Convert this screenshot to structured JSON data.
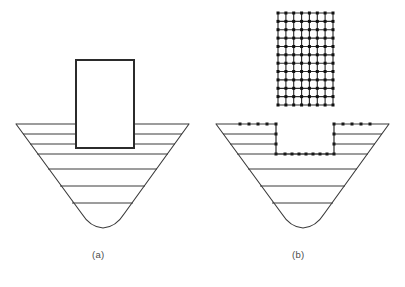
{
  "figure": {
    "background_color": "#ffffff",
    "line_color": "#3a3a3a",
    "node_color": "#1a1a1a",
    "caption_color": "#4a4a4a",
    "panels": [
      {
        "id": "a",
        "caption": "(a)",
        "description": "Stratified funnel-shaped vessel cross-section with embedded rectangular block at top center",
        "vessel": {
          "top_left_x": 16,
          "top_right_x": 189,
          "top_y": 124,
          "bottom_y": 228,
          "bottom_flat_left_x": 82,
          "bottom_flat_right_x": 124,
          "wall_taper": "linear-converging",
          "bottom_profile": "rounded-u",
          "layer_line_count": 8,
          "layer_line_y": [
            124,
            134,
            144,
            154,
            169,
            186,
            203,
            215
          ]
        },
        "block": {
          "left_x": 76,
          "right_x": 134,
          "top_y": 60,
          "bottom_y": 148,
          "fill": "#ffffff",
          "stroke_width": 2
        }
      },
      {
        "id": "b",
        "caption": "(b)",
        "description": "Same vessel with rectangular notch excavated at top center, node markers on excavation boundary, plus detached finite-element mesh of the excavated block above",
        "vessel": {
          "top_left_x": 216,
          "top_right_x": 389,
          "top_y": 124,
          "bottom_y": 228,
          "bottom_flat_left_x": 282,
          "bottom_flat_right_x": 324,
          "wall_taper": "linear-converging",
          "bottom_profile": "rounded-u",
          "layer_line_count": 8,
          "layer_line_y": [
            124,
            134,
            144,
            154,
            169,
            186,
            203,
            215
          ]
        },
        "notch": {
          "left_x": 276,
          "right_x": 334,
          "top_y": 124,
          "bottom_y": 154,
          "boundary_nodes": true,
          "node_count_top_left": 5,
          "node_count_top_right": 5,
          "node_count_bottom": 9,
          "node_count_left_wall": 3,
          "node_count_right_wall": 3
        },
        "mesh": {
          "left_x": 278,
          "right_x": 333,
          "top_y": 13,
          "bottom_y": 105,
          "columns": 7,
          "rows": 11,
          "nodes_visible": true,
          "node_radius": 1.5,
          "description": "Rectangular structured quadrilateral mesh"
        }
      }
    ]
  },
  "captions": {
    "panel_a": "(a)",
    "panel_b": "(b)"
  }
}
